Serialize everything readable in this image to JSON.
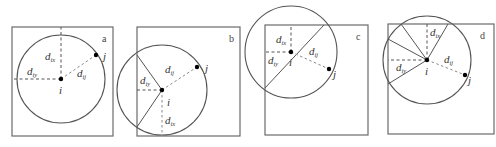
{
  "panels": [
    {
      "id": "a",
      "tag": "a",
      "frame": {
        "x": 12,
        "y": 27,
        "w": 101,
        "h": 109
      },
      "center": {
        "x": 61,
        "y": 79
      },
      "radius": 44,
      "point_j": {
        "x": 96,
        "y": 55
      },
      "labels": {
        "d_ix": {
          "base": "d",
          "sub": "ix"
        },
        "d_iy": {
          "base": "d",
          "sub": "iy"
        },
        "d_ij": {
          "base": "d",
          "sub": "ij"
        },
        "i": "i",
        "j": "j"
      }
    },
    {
      "id": "b",
      "tag": "b",
      "frame": {
        "x": 137,
        "y": 27,
        "w": 103,
        "h": 109
      },
      "center": {
        "x": 162,
        "y": 90
      },
      "radius": 45,
      "point_j": {
        "x": 197,
        "y": 67
      },
      "labels": {
        "d_ix": {
          "base": "d",
          "sub": "ix"
        },
        "d_iy": {
          "base": "d",
          "sub": "iy"
        },
        "d_ij": {
          "base": "d",
          "sub": "ij"
        },
        "i": "i",
        "j": "j"
      }
    },
    {
      "id": "c",
      "tag": "c",
      "frame": {
        "x": 265,
        "y": 25,
        "w": 103,
        "h": 110
      },
      "center": {
        "x": 291,
        "y": 52
      },
      "radius": 46,
      "point_j": {
        "x": 329,
        "y": 69
      },
      "labels": {
        "d_ix": {
          "base": "d",
          "sub": "ix"
        },
        "d_iy": {
          "base": "d",
          "sub": "iy"
        },
        "d_ij": {
          "base": "d",
          "sub": "ij"
        },
        "i": "i",
        "j": "j"
      }
    },
    {
      "id": "d",
      "tag": "d",
      "frame": {
        "x": 388,
        "y": 24,
        "w": 106,
        "h": 110
      },
      "center": {
        "x": 427,
        "y": 60
      },
      "radius": 44,
      "point_j": {
        "x": 465,
        "y": 75
      },
      "labels": {
        "d_ix": {
          "base": "d",
          "sub": "ix"
        },
        "d_iy": {
          "base": "d",
          "sub": "iy"
        },
        "d_ij": {
          "base": "d",
          "sub": "ij"
        },
        "i": "i",
        "j": "j"
      }
    }
  ]
}
